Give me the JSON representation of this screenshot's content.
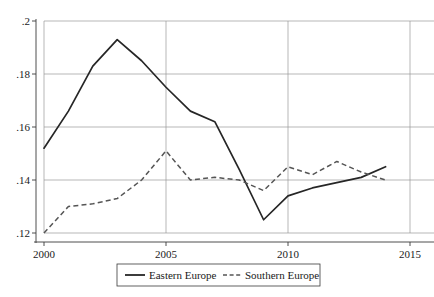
{
  "chart_data": {
    "type": "line",
    "title": "",
    "subtitle": "",
    "xlabel": "",
    "ylabel": "",
    "x": [
      2000,
      2001,
      2002,
      2003,
      2004,
      2005,
      2006,
      2007,
      2008,
      2009,
      2010,
      2011,
      2012,
      2013,
      2014
    ],
    "xlim": [
      2000,
      2015
    ],
    "ylim": [
      0.12,
      0.2
    ],
    "grid": true,
    "grid_axis": "y",
    "legend_position": "bottom-center",
    "xtick_values": [
      2000,
      2005,
      2010,
      2015
    ],
    "xtick_labels": [
      "2000",
      "2005",
      "2010",
      "2015"
    ],
    "ytick_values": [
      0.12,
      0.14,
      0.16,
      0.18,
      0.2
    ],
    "ytick_labels": [
      ".12",
      ".14",
      ".16",
      ".18",
      ".2"
    ],
    "series": [
      {
        "name": "Eastern Europe",
        "style": "solid",
        "color": "#262626",
        "values": [
          0.152,
          0.166,
          0.183,
          0.193,
          0.185,
          0.175,
          0.166,
          0.162,
          0.144,
          0.125,
          0.134,
          0.137,
          0.139,
          0.141,
          0.145
        ]
      },
      {
        "name": "Southern Europe",
        "style": "dashed",
        "color": "#555555",
        "values": [
          0.12,
          0.13,
          0.131,
          0.133,
          0.14,
          0.151,
          0.14,
          0.141,
          0.14,
          0.136,
          0.145,
          0.142,
          0.147,
          0.143,
          0.14
        ]
      }
    ]
  },
  "legend": {
    "entries": [
      {
        "label": "Eastern Europe",
        "style": "solid"
      },
      {
        "label": "Southern Europe",
        "style": "dashed"
      }
    ]
  }
}
